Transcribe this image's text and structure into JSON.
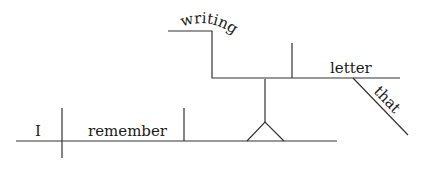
{
  "diagram": {
    "type": "sentence-diagram",
    "sentence_words": {
      "subject": "I",
      "verb": "remember",
      "gerund": "writing",
      "object": "letter",
      "modifier": "that"
    },
    "line_color": "#333333",
    "text_color": "#1a1a1a"
  }
}
